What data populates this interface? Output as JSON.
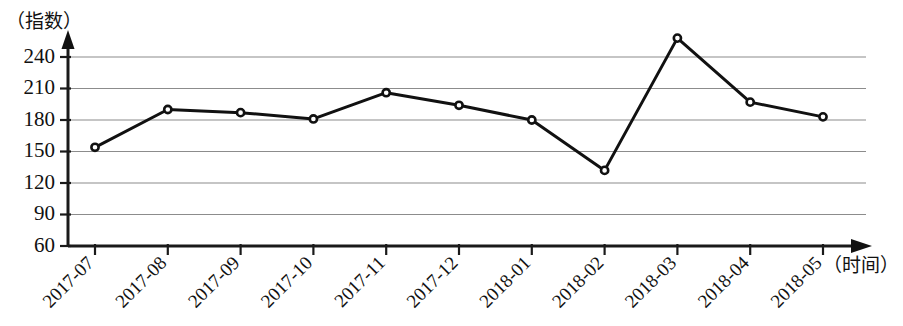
{
  "chart_data": {
    "type": "line",
    "title": "",
    "ylabel": "（指数）",
    "xlabel": "（时间）",
    "categories": [
      "2017-07",
      "2017-08",
      "2017-09",
      "2017-10",
      "2017-11",
      "2017-12",
      "2018-01",
      "2018-02",
      "2018-03",
      "2018-04",
      "2018-05"
    ],
    "values": [
      154,
      190,
      187,
      181,
      206,
      194,
      180,
      132,
      258,
      197,
      183
    ],
    "series": [
      {
        "name": "指数",
        "values": [
          154,
          190,
          187,
          181,
          206,
          194,
          180,
          132,
          258,
          197,
          183
        ]
      }
    ],
    "ylim": [
      60,
      255
    ],
    "yticks": [
      60,
      90,
      120,
      150,
      180,
      210,
      240
    ],
    "ytick_labels": [
      "60",
      "90",
      "120",
      "150",
      "180",
      "210",
      "240"
    ],
    "grid": true,
    "grid_axis": "y",
    "legend": null,
    "marker": "open-circle",
    "line_color": "#111111",
    "grid_color": "#8c8c8c",
    "axis_color": "#1a1a1a"
  },
  "axes": {
    "y_caption": "（指数）",
    "x_caption": "（时间）"
  }
}
